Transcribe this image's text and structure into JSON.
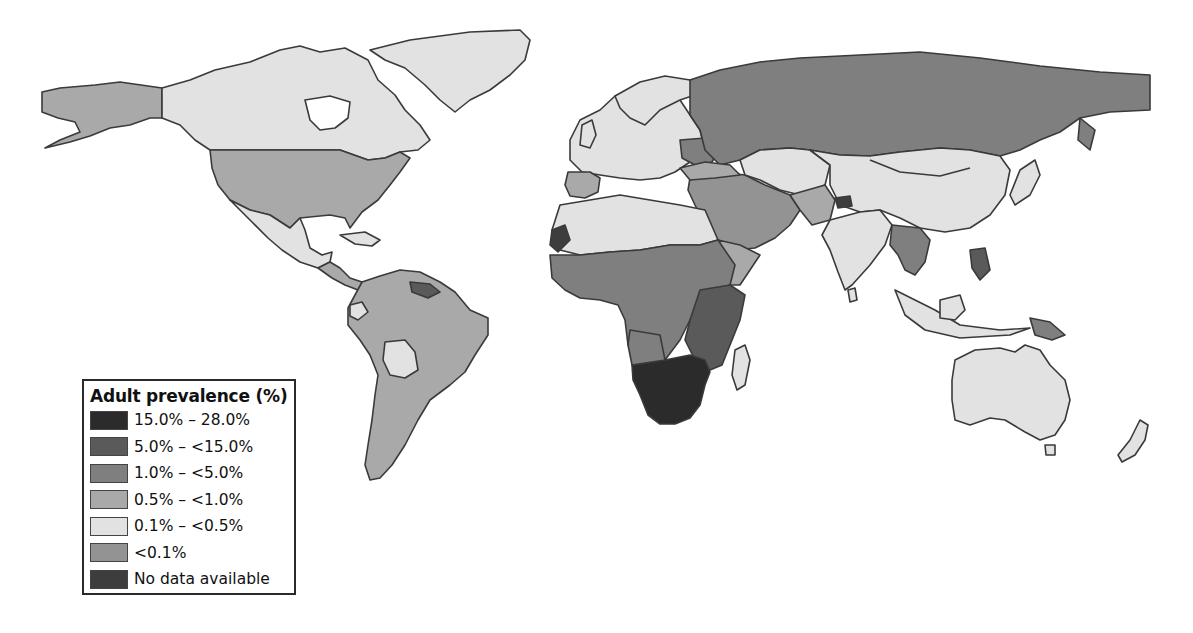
{
  "legend": {
    "title": "Adult prevalence (%)",
    "items": [
      {
        "label": "15.0% – 28.0%",
        "color": "#2b2b2b"
      },
      {
        "label": "5.0% – <15.0%",
        "color": "#5a5a5a"
      },
      {
        "label": "1.0% – <5.0%",
        "color": "#7f7f7f"
      },
      {
        "label": "0.5% – <1.0%",
        "color": "#a9a9a9"
      },
      {
        "label": "0.1% – <0.5%",
        "color": "#e2e2e2"
      },
      {
        "label": "<0.1%",
        "color": "#939393"
      },
      {
        "label": "No data available",
        "color": "#3d3d3d"
      }
    ]
  },
  "regions": [
    {
      "name": "Alaska",
      "category": "0.5% – <1.0%"
    },
    {
      "name": "Canada",
      "category": "0.1% – <0.5%"
    },
    {
      "name": "Greenland",
      "category": "0.1% – <0.5%"
    },
    {
      "name": "United States",
      "category": "0.5% – <1.0%"
    },
    {
      "name": "Mexico",
      "category": "0.1% – <0.5%"
    },
    {
      "name": "South America",
      "category": "0.5% – <1.0%"
    },
    {
      "name": "Bolivia",
      "category": "0.1% – <0.5%"
    },
    {
      "name": "Europe",
      "category": "0.1% – <0.5%"
    },
    {
      "name": "Russia",
      "category": "1.0% – <5.0%"
    },
    {
      "name": "North Africa",
      "category": "0.1% – <0.5%"
    },
    {
      "name": "West & Central Africa",
      "category": "1.0% – <5.0%"
    },
    {
      "name": "East Africa",
      "category": "5.0% – <15.0%"
    },
    {
      "name": "Southern Africa",
      "category": "15.0% – 28.0%"
    },
    {
      "name": "Madagascar",
      "category": "0.1% – <0.5%"
    },
    {
      "name": "Middle East",
      "category": "<0.1%"
    },
    {
      "name": "Central Asia",
      "category": "0.1% – <0.5%"
    },
    {
      "name": "China & Mongolia",
      "category": "0.1% – <0.5%"
    },
    {
      "name": "India",
      "category": "0.1% – <0.5%"
    },
    {
      "name": "Southeast Asia",
      "category": "1.0% – <5.0%"
    },
    {
      "name": "Papua New Guinea",
      "category": "1.0% – <5.0%"
    },
    {
      "name": "Australia",
      "category": "0.1% – <0.5%"
    },
    {
      "name": "New Zealand",
      "category": "0.1% – <0.5%"
    }
  ],
  "colors": {
    "background": "#ffffff",
    "border": "#3a3a3a"
  }
}
